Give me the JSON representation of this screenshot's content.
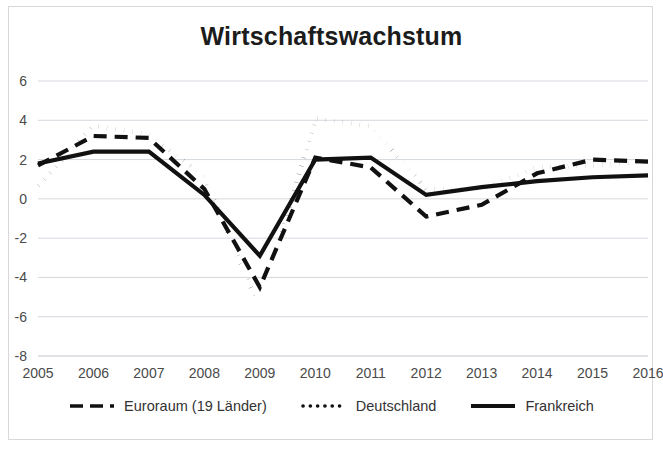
{
  "figure": {
    "title": "Wirtschaftswachstum",
    "background_color": "#ffffff",
    "ink_color": "#111111",
    "grid_color": "#d4d9de",
    "axis_text_color": "#4a4a4a"
  },
  "legend": {
    "position": "bottom",
    "items": [
      {
        "label": "Euroraum (19 Länder)",
        "style": "dashed",
        "swatch": "dash-swatch"
      },
      {
        "label": "Deutschland",
        "style": "dotted",
        "swatch": "dot-swatch"
      },
      {
        "label": "Frankreich",
        "style": "solid",
        "swatch": "solid-swatch"
      }
    ]
  },
  "axes": {
    "y_ticks": [
      "6",
      "4",
      "2",
      "0",
      "-2",
      "-4",
      "-6",
      "-8"
    ],
    "x_ticks": [
      "2005",
      "2006",
      "2007",
      "2008",
      "2009",
      "2010",
      "2011",
      "2012",
      "2013",
      "2014",
      "2015",
      "2016"
    ]
  },
  "chart_data": {
    "type": "line",
    "title": "Wirtschaftswachstum",
    "xlabel": "",
    "ylabel": "",
    "grid": true,
    "legend_position": "bottom",
    "ylim": [
      -8,
      6
    ],
    "ytick_step": 2,
    "categories": [
      "2005",
      "2006",
      "2007",
      "2008",
      "2009",
      "2010",
      "2011",
      "2012",
      "2013",
      "2014",
      "2015",
      "2016"
    ],
    "series": [
      {
        "name": "Euroraum (19 Länder)",
        "style": "dashed",
        "values": [
          1.7,
          3.2,
          3.1,
          0.5,
          -4.5,
          2.1,
          1.6,
          -0.9,
          -0.3,
          1.3,
          2.0,
          1.9
        ]
      },
      {
        "name": "Deutschland",
        "style": "dotted",
        "values": [
          0.7,
          3.7,
          3.3,
          1.1,
          -5.6,
          4.1,
          3.7,
          0.5,
          0.5,
          1.6,
          1.7,
          1.9
        ]
      },
      {
        "name": "Frankreich",
        "style": "solid",
        "values": [
          1.8,
          2.4,
          2.4,
          0.2,
          -2.9,
          2.0,
          2.1,
          0.2,
          0.6,
          0.9,
          1.1,
          1.2
        ]
      }
    ]
  }
}
